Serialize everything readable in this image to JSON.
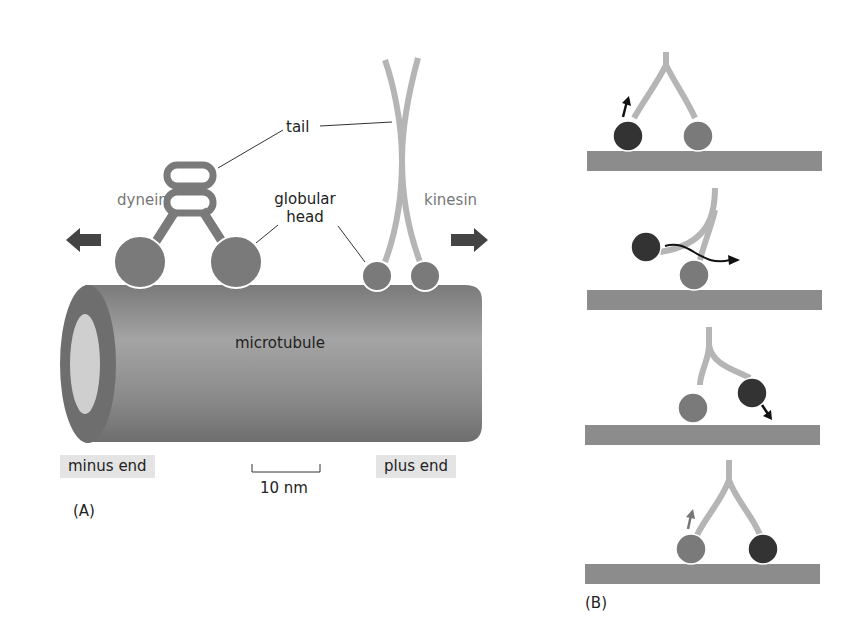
{
  "panel_a": {
    "label": "(A)",
    "labels": {
      "tail": "tail",
      "globular_head_line1": "globular",
      "globular_head_line2": "head",
      "dynein": "dynein",
      "kinesin": "kinesin",
      "microtubule": "microtubule",
      "minus_end": "minus end",
      "plus_end": "plus end",
      "scale_bar": "10 nm"
    },
    "icons": {
      "left_arrow": "arrow-left-icon",
      "right_arrow": "arrow-right-icon"
    }
  },
  "panel_b": {
    "label": "(B)",
    "steps": [
      {
        "step": 1,
        "description": "dark head lifts off (arrow up)"
      },
      {
        "step": 2,
        "description": "dark head swings forward past grey head (curved arrow)"
      },
      {
        "step": 3,
        "description": "dark head lands ahead (arrow down)"
      },
      {
        "step": 4,
        "description": "grey head lifts off (arrow up)"
      }
    ]
  },
  "colors": {
    "microtubule": "#8a8a8a",
    "head": "#7a7a7a",
    "dark_head": "#333333",
    "tail": "#b5b5b5",
    "arrow": "#444444",
    "track": "#8c8c8c",
    "label_box": "#e4e4e4"
  }
}
